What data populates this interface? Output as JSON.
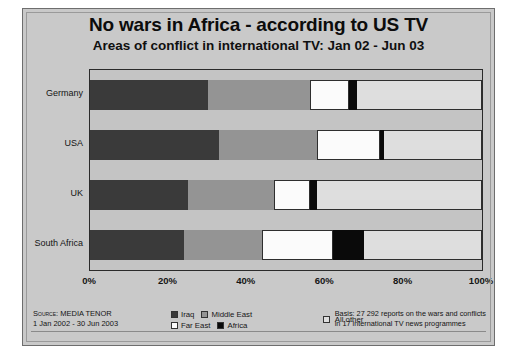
{
  "title": "No wars in Africa - according to US TV",
  "subtitle": "Areas of conflict in international TV: Jan 02 - Jun 03",
  "source": {
    "line1": "Source: MEDIA TENOR",
    "line2": "1 Jan 2002 - 30 Jun 2003"
  },
  "basis": {
    "line1": "Basis: 27 292 reports on the wars and conflicts",
    "line2": "in 17 international TV news programmes"
  },
  "legend": [
    {
      "label": "Iraq",
      "color": "#3a3a3a"
    },
    {
      "label": "Middle East",
      "color": "#949494"
    },
    {
      "label": "Far East",
      "color": "#fbfbfb"
    },
    {
      "label": "Africa",
      "color": "#0a0a0a"
    },
    {
      "label": "All other",
      "color": "#dedede"
    }
  ],
  "chart_data": {
    "type": "bar",
    "orientation": "horizontal",
    "stacked": true,
    "normalized_percent": true,
    "title": "No wars in Africa - according to US TV",
    "subtitle": "Areas of conflict in international TV: Jan 02 - Jun 03",
    "xlabel": "",
    "ylabel": "",
    "xlim": [
      0,
      100
    ],
    "xticks": [
      0,
      20,
      40,
      60,
      80,
      100
    ],
    "xtick_labels": [
      "0%",
      "20%",
      "40%",
      "60%",
      "80%",
      "100%"
    ],
    "grid": false,
    "legend_position": "bottom",
    "categories": [
      "Germany",
      "USA",
      "UK",
      "South Africa"
    ],
    "series": [
      {
        "name": "Iraq",
        "color": "#3a3a3a",
        "values": [
          30,
          33,
          25,
          24
        ]
      },
      {
        "name": "Middle East",
        "color": "#949494",
        "values": [
          26,
          25,
          22,
          20
        ]
      },
      {
        "name": "Far East",
        "color": "#fbfbfb",
        "values": [
          10,
          16,
          9,
          18
        ]
      },
      {
        "name": "Africa",
        "color": "#0a0a0a",
        "values": [
          2,
          1,
          2,
          8
        ]
      },
      {
        "name": "All other",
        "color": "#dedede",
        "values": [
          32,
          25,
          42,
          30
        ]
      }
    ]
  }
}
